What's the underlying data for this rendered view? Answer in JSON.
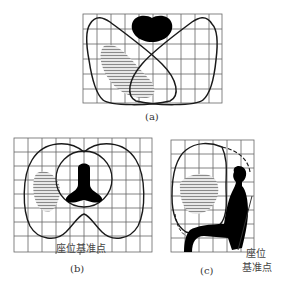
{
  "figure": {
    "panels": [
      {
        "id": "a",
        "caption": "(a)",
        "view": "top"
      },
      {
        "id": "b",
        "caption": "(b)",
        "view": "front",
        "seat_label": "座位基准点"
      },
      {
        "id": "c",
        "caption": "(c)",
        "view": "side",
        "seat_label_line1": "座位",
        "seat_label_line2": "基准点"
      }
    ],
    "colors": {
      "grid": "#555555",
      "outline": "#1a1a1a",
      "figure": "#000000",
      "hatch": "#888888",
      "background": "#ffffff"
    }
  }
}
